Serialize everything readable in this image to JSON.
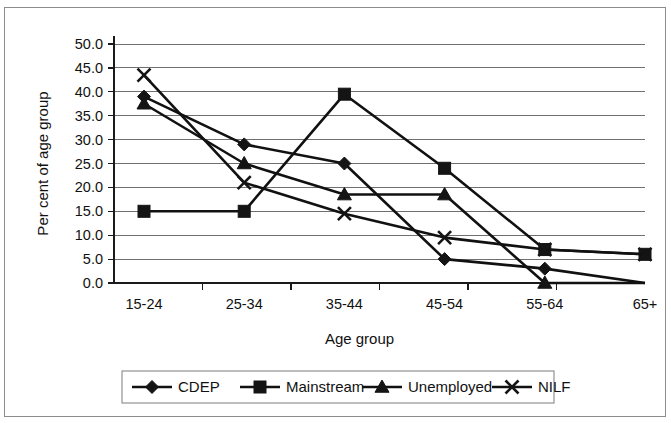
{
  "chart_data": {
    "type": "line",
    "title": "",
    "xlabel": "Age group",
    "ylabel": "Per cent of age group",
    "categories": [
      "15-24",
      "25-34",
      "35-44",
      "45-54",
      "55-64",
      "65+"
    ],
    "ylim": [
      0,
      50
    ],
    "ytick_step": 5,
    "ytick_labels": [
      "0.0",
      "5.0",
      "10.0",
      "15.0",
      "20.0",
      "25.0",
      "30.0",
      "35.0",
      "40.0",
      "45.0",
      "50.0"
    ],
    "grid": true,
    "legend_position": "bottom",
    "series": [
      {
        "name": "CDEP",
        "marker": "diamond",
        "color": "#141414",
        "values": [
          39.0,
          29.0,
          25.0,
          5.0,
          3.0,
          0.0
        ]
      },
      {
        "name": "Mainstream",
        "marker": "square",
        "color": "#141414",
        "values": [
          15.0,
          15.0,
          39.5,
          24.0,
          7.0,
          6.0
        ]
      },
      {
        "name": "Unemployed",
        "marker": "triangle",
        "color": "#141414",
        "values": [
          37.5,
          25.0,
          18.5,
          18.5,
          0.0,
          0.0
        ]
      },
      {
        "name": "NILF",
        "marker": "x",
        "color": "#141414",
        "values": [
          43.5,
          21.0,
          14.5,
          9.5,
          7.0,
          6.0
        ]
      }
    ]
  }
}
